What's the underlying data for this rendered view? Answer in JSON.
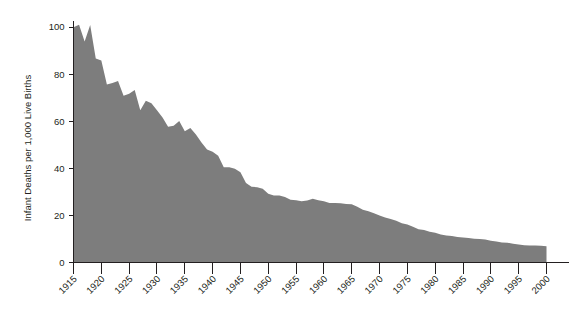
{
  "chart_data": {
    "type": "area",
    "title": "",
    "subtitle": "",
    "xlabel": "",
    "ylabel": "Infant Deaths per 1,000 Live Births",
    "xlim": [
      1915,
      2000
    ],
    "ylim": [
      0,
      100
    ],
    "grid": false,
    "legend": null,
    "fill_color": "#7d7d7d",
    "axis_color": "#231f20",
    "background": "#ffffff",
    "y_ticks": [
      0,
      20,
      40,
      60,
      80,
      100
    ],
    "y_tick_labels": [
      "0",
      "20",
      "40",
      "60",
      "80",
      "100"
    ],
    "x_ticks": [
      1915,
      1920,
      1925,
      1930,
      1935,
      1940,
      1945,
      1950,
      1955,
      1960,
      1965,
      1970,
      1975,
      1980,
      1985,
      1990,
      1995,
      2000
    ],
    "x_tick_labels": [
      "1915",
      "1920",
      "1925",
      "1930",
      "1935",
      "1940",
      "1945",
      "1950",
      "1955",
      "1960",
      "1965",
      "1970",
      "1975",
      "1980",
      "1985",
      "1990",
      "1995",
      "2000"
    ],
    "x_tick_label_rotation": -45,
    "x": [
      1915,
      1916,
      1917,
      1918,
      1919,
      1920,
      1921,
      1922,
      1923,
      1924,
      1925,
      1926,
      1927,
      1928,
      1929,
      1930,
      1931,
      1932,
      1933,
      1934,
      1935,
      1936,
      1937,
      1938,
      1939,
      1940,
      1941,
      1942,
      1943,
      1944,
      1945,
      1946,
      1947,
      1948,
      1949,
      1950,
      1951,
      1952,
      1953,
      1954,
      1955,
      1956,
      1957,
      1958,
      1959,
      1960,
      1961,
      1962,
      1963,
      1964,
      1965,
      1966,
      1967,
      1968,
      1969,
      1970,
      1971,
      1972,
      1973,
      1974,
      1975,
      1976,
      1977,
      1978,
      1979,
      1980,
      1981,
      1982,
      1983,
      1984,
      1985,
      1986,
      1987,
      1988,
      1989,
      1990,
      1991,
      1992,
      1993,
      1994,
      1995,
      1996,
      1997,
      1998,
      1999,
      2000
    ],
    "y": [
      99.9,
      101.0,
      93.8,
      100.9,
      86.6,
      85.8,
      75.6,
      76.2,
      77.1,
      70.8,
      71.7,
      73.3,
      64.6,
      68.7,
      67.6,
      64.6,
      61.6,
      57.6,
      58.1,
      60.1,
      55.7,
      57.1,
      54.4,
      51.0,
      48.0,
      47.0,
      45.3,
      40.4,
      40.4,
      39.8,
      38.3,
      33.8,
      32.2,
      32.0,
      31.3,
      29.2,
      28.4,
      28.4,
      27.8,
      26.6,
      26.4,
      26.0,
      26.3,
      27.1,
      26.4,
      26.0,
      25.3,
      25.3,
      25.2,
      24.8,
      24.7,
      23.7,
      22.4,
      21.8,
      20.9,
      20.0,
      19.1,
      18.5,
      17.7,
      16.7,
      16.1,
      15.2,
      14.1,
      13.8,
      13.1,
      12.6,
      11.9,
      11.5,
      11.2,
      10.8,
      10.6,
      10.4,
      10.1,
      10.0,
      9.8,
      9.2,
      8.9,
      8.5,
      8.4,
      8.0,
      7.6,
      7.3,
      7.2,
      7.2,
      7.1,
      6.9
    ]
  },
  "labels": {
    "y_axis_title": "Infant Deaths per 1,000 Live Births"
  }
}
